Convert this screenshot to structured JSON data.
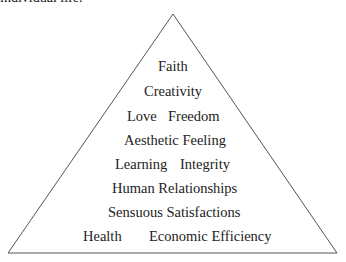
{
  "caption": {
    "text": "individual life."
  },
  "pyramid": {
    "apex": [
      173,
      14
    ],
    "base_left": [
      8,
      253
    ],
    "base_right": [
      337,
      253
    ],
    "stroke_color": "#555555",
    "text_color": "#222222",
    "levels": [
      {
        "level": 1,
        "items": [
          "Faith"
        ]
      },
      {
        "level": 2,
        "items": [
          "Creativity"
        ]
      },
      {
        "level": 3,
        "items": [
          "Love",
          "Freedom"
        ]
      },
      {
        "level": 4,
        "items": [
          "Aesthetic Feeling"
        ]
      },
      {
        "level": 5,
        "items": [
          "Learning",
          "Integrity"
        ]
      },
      {
        "level": 6,
        "items": [
          "Human Relationships"
        ]
      },
      {
        "level": 7,
        "items": [
          "Sensuous Satisfactions"
        ]
      },
      {
        "level": 8,
        "items": [
          "Health",
          "Economic Efficiency"
        ]
      }
    ]
  }
}
